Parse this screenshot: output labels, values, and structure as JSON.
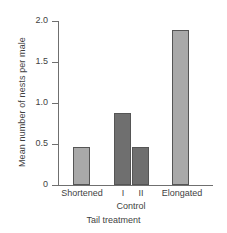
{
  "chart_data": {
    "type": "bar",
    "title": "",
    "xlabel": "Tail treatment",
    "ylabel": "Mean number of nests per male",
    "categories": [
      "Shortened",
      "I",
      "II",
      "Elongated"
    ],
    "values": [
      0.46,
      0.88,
      0.46,
      1.89
    ],
    "group_label": "Control",
    "group_members": [
      "I",
      "II"
    ],
    "ylim": [
      0,
      2.0
    ],
    "yticks": [
      "0",
      "0.5",
      "1.0",
      "1.5",
      "2.0"
    ],
    "ytick_values": [
      0,
      0.5,
      1.0,
      1.5,
      2.0
    ],
    "grid": false,
    "legend": "none",
    "bar_colors": [
      "#a9a9a9",
      "#6f6f6f",
      "#6f6f6f",
      "#a9a9a9"
    ],
    "bar_edge_color": "#555555",
    "axis_color": "#6f6f6f",
    "text_color": "#3f3f3f",
    "background": "#ffffff"
  },
  "bars": [
    {
      "label": "Shortened",
      "value": 0.46,
      "color": "#a9a9a9",
      "left": 15,
      "width": 17
    },
    {
      "label": "I",
      "value": 0.88,
      "color": "#6f6f6f",
      "left": 56,
      "width": 17
    },
    {
      "label": "II",
      "value": 0.46,
      "color": "#6f6f6f",
      "left": 74,
      "width": 17
    },
    {
      "label": "Elongated",
      "value": 1.89,
      "color": "#a9a9a9",
      "left": 114,
      "width": 17
    }
  ],
  "xtick_labels": [
    {
      "text": "Shortened",
      "left": 56,
      "width": 52
    },
    {
      "text": "I",
      "left": 115,
      "width": 16
    },
    {
      "text": "II",
      "left": 133,
      "width": 16
    },
    {
      "text": "Elongated",
      "left": 155,
      "width": 54
    }
  ]
}
